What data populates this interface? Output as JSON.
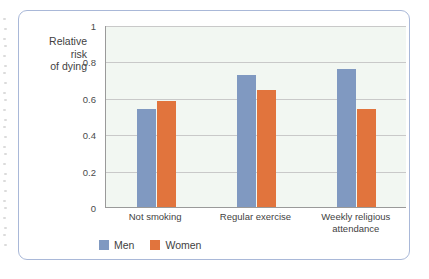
{
  "chart_data": {
    "type": "bar",
    "title": "",
    "subtitle": "",
    "xlabel": "",
    "ylabel": "Relative risk of dying",
    "ylabel_lines": [
      "Relative",
      "risk",
      "of dying"
    ],
    "categories": [
      "Not smoking",
      "Regular exercise",
      "Weekly religious attendance"
    ],
    "category_lines": [
      [
        "Not smoking"
      ],
      [
        "Regular exercise"
      ],
      [
        "Weekly religious",
        "attendance"
      ]
    ],
    "series": [
      {
        "name": "Men",
        "color": "#8099c1",
        "values": [
          0.54,
          0.725,
          0.76
        ]
      },
      {
        "name": "Women",
        "color": "#e1743d",
        "values": [
          0.585,
          0.645,
          0.54
        ]
      }
    ],
    "ylim": [
      0,
      1
    ],
    "yticks": [
      0,
      0.2,
      0.4,
      0.6,
      0.8,
      1
    ],
    "ytick_labels": [
      "0",
      "0.2",
      "0.4",
      "0.6",
      "0.8",
      "1"
    ],
    "grid": "horizontal",
    "legend_position": "bottom-left",
    "plot_background": "#f2f7f2",
    "gridline_color": "#c9c9c9",
    "axis_color": "#9a9a9a",
    "frame_color": "#a9b8d8"
  },
  "legend": {
    "items": [
      {
        "label": "Men"
      },
      {
        "label": "Women"
      }
    ]
  }
}
